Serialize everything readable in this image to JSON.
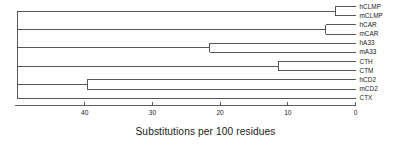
{
  "chart_data": {
    "type": "tree",
    "title": "",
    "xlabel": "Substitutions per 100 residues",
    "ylabel": "",
    "axis": {
      "ticks": [
        40,
        30,
        20,
        10,
        0
      ],
      "tick_labels": [
        "40",
        "30",
        "20",
        "10",
        "0"
      ],
      "reversed": true,
      "xlim": [
        50,
        0
      ],
      "grid": false
    },
    "leaves": [
      {
        "name": "hCLMP",
        "row": 0
      },
      {
        "name": "mCLMP",
        "row": 1
      },
      {
        "name": "hCAR",
        "row": 2
      },
      {
        "name": "mCAR",
        "row": 3
      },
      {
        "name": "hA33",
        "row": 4
      },
      {
        "name": "mA33",
        "row": 5
      },
      {
        "name": "CTH",
        "row": 6
      },
      {
        "name": "CTM",
        "row": 7
      },
      {
        "name": "hCD2",
        "row": 8
      },
      {
        "name": "mCD2",
        "row": 9
      },
      {
        "name": "CTX",
        "row": 10
      }
    ],
    "nodes": [
      {
        "id": "clmp",
        "label": "hCLMP + mCLMP",
        "distance": 3.0,
        "children": [
          "hCLMP",
          "mCLMP"
        ]
      },
      {
        "id": "car",
        "label": "hCAR + mCAR",
        "distance": 4.4,
        "children": [
          "hCAR",
          "mCAR"
        ]
      },
      {
        "id": "ct",
        "label": "CTH + CTM",
        "distance": 11.4,
        "children": [
          "CTH",
          "CTM"
        ]
      },
      {
        "id": "a33",
        "label": "hA33 + mA33",
        "distance": 21.5,
        "children": [
          "hA33",
          "mA33"
        ]
      },
      {
        "id": "cd2",
        "label": "hCD2 + mCD2",
        "distance": 39.6,
        "children": [
          "hCD2",
          "mCD2"
        ]
      },
      {
        "id": "root",
        "label": "root",
        "distance": 50.0,
        "children": [
          "clmp",
          "car",
          "a33",
          "ct",
          "cd2",
          "CTX"
        ]
      }
    ],
    "colors": {
      "line": "#3a3a3a",
      "axis": "#4a4a4a",
      "text": "#1a1a1a",
      "background": "#ffffff"
    }
  },
  "figure": {
    "leaf_labels": [
      "hCLMP",
      "mCLMP",
      "hCAR",
      "mCAR",
      "hA33",
      "mA33",
      "CTH",
      "CTM",
      "hCD2",
      "mCD2",
      "CTX"
    ],
    "tick_labels": [
      "40",
      "30",
      "20",
      "10",
      "0"
    ],
    "axis_title": "Substitutions per 100 residues"
  }
}
